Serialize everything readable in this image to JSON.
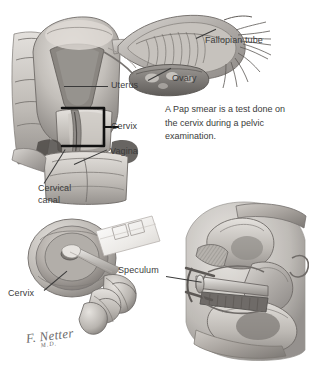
{
  "figure": {
    "background_color": "#ffffff",
    "label_color": "#3b3b3b",
    "leader_color": "#3a3a3a",
    "bracket_color": "#111111",
    "width": 309,
    "height": 365
  },
  "note": {
    "text": "A Pap smear is a test done on the cervix during a pelvic examination."
  },
  "labels": {
    "fallopian_tube": "Fallopian tube",
    "ovary": "Ovary",
    "uterus": "Uterus",
    "cervix": "Cervix",
    "vagina": "Vagina",
    "cervical_canal_line1": "Cervical",
    "cervical_canal_line2": "canal",
    "cervix_lower": "Cervix",
    "speculum": "Speculum"
  },
  "panels": {
    "upper": {
      "name": "coronal-uterus-section",
      "parts": [
        "fundus",
        "uterine-cavity",
        "fallopian-tube",
        "fimbriae",
        "ovary",
        "cervix",
        "cervical-canal",
        "vagina",
        "broad-ligament"
      ]
    },
    "lower_left": {
      "name": "cervix-through-speculum-view",
      "parts": [
        "cervix-face",
        "external-os",
        "spatula",
        "glass-slide",
        "clinician-fingers"
      ]
    },
    "lower_right": {
      "name": "sagittal-pelvis-with-speculum",
      "parts": [
        "bladder",
        "uterus",
        "speculum",
        "rectum",
        "pubic-bone",
        "vagina"
      ]
    }
  },
  "signature": {
    "name": "F. Netter",
    "suffix": "M.D."
  }
}
